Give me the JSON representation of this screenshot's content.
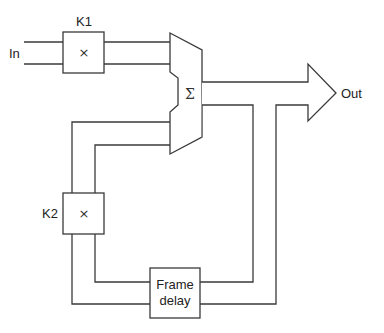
{
  "diagram": {
    "type": "block-diagram",
    "title": "",
    "input_label": "In",
    "output_label": "Out",
    "blocks": [
      {
        "id": "k1",
        "label": "K1",
        "symbol": "×"
      },
      {
        "id": "summer",
        "label": "",
        "symbol": "Σ"
      },
      {
        "id": "k2",
        "label": "K2",
        "symbol": "×"
      },
      {
        "id": "delay",
        "label_line1": "Frame",
        "label_line2": "delay"
      }
    ],
    "connections": [
      {
        "from": "In",
        "to": "k1"
      },
      {
        "from": "k1",
        "to": "summer"
      },
      {
        "from": "summer",
        "to": "Out"
      },
      {
        "from": "summer",
        "to": "delay"
      },
      {
        "from": "delay",
        "to": "k2"
      },
      {
        "from": "k2",
        "to": "summer"
      }
    ]
  }
}
